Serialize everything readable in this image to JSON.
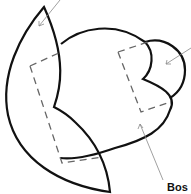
{
  "diagram": {
    "type": "line-drawing",
    "shapes": [
      {
        "name": "left-petal",
        "style": "solid"
      },
      {
        "name": "central-body",
        "style": "solid"
      },
      {
        "name": "right-lobe",
        "style": "solid"
      },
      {
        "name": "left-dashed-region",
        "style": "dashed"
      },
      {
        "name": "right-dashed-region",
        "style": "dashed"
      }
    ],
    "leader_lines": [
      {
        "name": "top-left-leader",
        "target": "left-petal"
      },
      {
        "name": "right-leader",
        "target": "right-lobe"
      },
      {
        "name": "bottom-right-leader",
        "target": "central-body"
      }
    ],
    "labels": [
      {
        "text": "Bos",
        "target": "central-body"
      }
    ],
    "colors": {
      "stroke": "#111111",
      "dashed": "#666666",
      "leader": "#888888"
    }
  }
}
